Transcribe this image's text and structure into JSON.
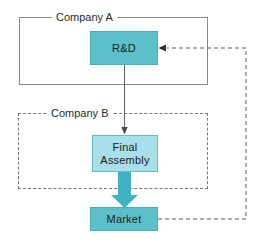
{
  "diagram": {
    "background_color": "#ffffff",
    "groups": [
      {
        "id": "company-a",
        "label": "Company A",
        "border_style": "solid",
        "border_color": "#8a8a8a"
      },
      {
        "id": "company-b",
        "label": "Company B",
        "border_style": "dashed",
        "border_color": "#777777"
      }
    ],
    "nodes": [
      {
        "id": "rd",
        "label": "R&D",
        "fill_color": "#5cbfcb",
        "border_color": "#4aadb9",
        "group": "company-a"
      },
      {
        "id": "final-assembly",
        "label": "Final\nAssembly",
        "fill_color": "#a8dfe8",
        "border_color": "#63bdcb",
        "group": "company-b"
      },
      {
        "id": "market",
        "label": "Market",
        "fill_color": "#5cbfcb",
        "border_color": "#4aadb9",
        "group": "none"
      }
    ],
    "connectors": [
      {
        "id": "rd-to-final-assembly",
        "from": "rd",
        "to": "final-assembly",
        "style": "thin-solid-arrow",
        "color": "#6b6b6b",
        "direction": "down"
      },
      {
        "id": "final-assembly-to-market",
        "from": "final-assembly",
        "to": "market",
        "style": "thick-block-arrow",
        "color": "#3fb3c2",
        "direction": "down"
      },
      {
        "id": "market-to-rd-feedback",
        "from": "market",
        "to": "rd",
        "style": "dashed-arrow",
        "color": "#5a5a5a",
        "direction": "left",
        "routing": "right-side-loop"
      }
    ]
  }
}
